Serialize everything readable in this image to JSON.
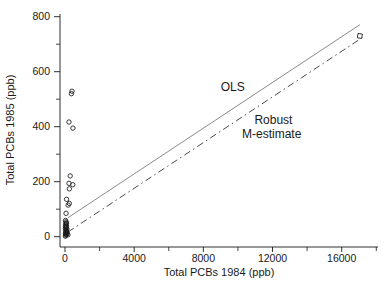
{
  "figure": {
    "background": "#ffffff",
    "axis_color": "#1a1a1a",
    "text_color": "#1a1a1a",
    "ols_line_color": "#7d7d7d",
    "robust_line_color": "#4a4a4a",
    "marker_color": "#1a1a1a"
  },
  "chart_data": {
    "type": "scatter",
    "title": "",
    "xlabel": "Total PCBs 1984 (ppb)",
    "ylabel": "Total PCBs 1985 (ppb)",
    "xlim": [
      0,
      18000
    ],
    "ylim": [
      0,
      810
    ],
    "grid": false,
    "x_ticks": [
      0,
      4000,
      8000,
      12000,
      16000
    ],
    "x_minor_ticks": [
      2000,
      6000,
      10000,
      14000,
      18000
    ],
    "y_ticks": [
      0,
      200,
      400,
      600,
      800
    ],
    "y_minor_ticks": [
      100,
      300,
      500,
      700
    ],
    "series": [
      {
        "name": "observations",
        "marker": "circle",
        "points": [
          [
            370,
            520
          ],
          [
            405,
            529
          ],
          [
            230,
            417
          ],
          [
            460,
            395
          ],
          [
            300,
            221
          ],
          [
            230,
            194
          ],
          [
            450,
            189
          ],
          [
            250,
            174
          ],
          [
            90,
            136
          ],
          [
            250,
            121
          ],
          [
            180,
            115
          ],
          [
            60,
            85
          ],
          [
            20,
            2
          ],
          [
            45,
            5
          ],
          [
            80,
            8
          ],
          [
            30,
            12
          ],
          [
            60,
            15
          ],
          [
            100,
            18
          ],
          [
            40,
            22
          ],
          [
            75,
            26
          ],
          [
            25,
            30
          ],
          [
            55,
            34
          ],
          [
            90,
            38
          ],
          [
            35,
            43
          ],
          [
            65,
            48
          ],
          [
            50,
            54
          ],
          [
            30,
            59
          ],
          [
            130,
            12
          ],
          [
            170,
            7
          ],
          [
            110,
            28
          ],
          [
            85,
            50
          ],
          [
            45,
            38
          ],
          [
            70,
            20
          ],
          [
            55,
            10
          ]
        ]
      },
      {
        "name": "outlier",
        "marker": "square",
        "points": [
          [
            17050,
            730
          ]
        ]
      }
    ],
    "fit_lines": [
      {
        "name": "OLS",
        "style": "solid",
        "start": [
          170,
          69
        ],
        "end": [
          17050,
          771
        ]
      },
      {
        "name": "Robust M-estimate",
        "style": "dashdot",
        "start": [
          170,
          17
        ],
        "end": [
          17120,
          721
        ]
      }
    ],
    "annotations": [
      {
        "text": "OLS",
        "x": 9700,
        "y": 544
      },
      {
        "text": "Robust",
        "x": 12050,
        "y": 424
      },
      {
        "text": "M-estimate",
        "x": 11950,
        "y": 375
      }
    ]
  }
}
